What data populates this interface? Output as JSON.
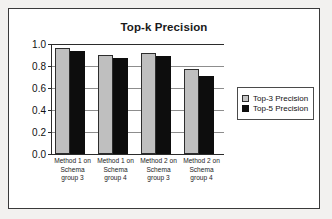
{
  "chart_data": {
    "type": "bar",
    "title": "Top-k Precision",
    "xlabel": "",
    "ylabel": "",
    "ylim": [
      0.0,
      1.0
    ],
    "yticks": [
      "0.0",
      "0.2",
      "0.4",
      "0.6",
      "0.8",
      "1.0"
    ],
    "grid": true,
    "legend_position": "right",
    "categories": [
      "Method 1 on Schema group 3",
      "Method 1 on Schema group 4",
      "Method 2 on Schema group 3",
      "Method 2 on Schema group 4"
    ],
    "category_lines": [
      [
        "Method 1 on",
        "Schema",
        "group 3"
      ],
      [
        "Method 1 on",
        "Schema",
        "group 4"
      ],
      [
        "Method 2 on",
        "Schema",
        "group 3"
      ],
      [
        "Method 2 on",
        "Schema",
        "group 4"
      ]
    ],
    "series": [
      {
        "name": "Top-3 Precision",
        "color": "#bfbfbf",
        "values": [
          0.96,
          0.9,
          0.92,
          0.77
        ]
      },
      {
        "name": "Top-5 Precision",
        "color": "#0d0d0d",
        "values": [
          0.94,
          0.87,
          0.89,
          0.71
        ]
      }
    ]
  },
  "legend": {
    "items": [
      {
        "label": "Top-3 Precision"
      },
      {
        "label": "Top-5 Precision"
      }
    ]
  },
  "axis": {
    "y_labels": [
      "1.0",
      "0.8",
      "0.6",
      "0.4",
      "0.2",
      "0.0"
    ]
  }
}
